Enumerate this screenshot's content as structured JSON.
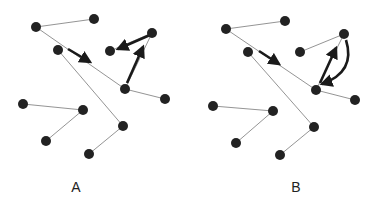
{
  "colors": {
    "node": "#222222",
    "edge": "#888888",
    "arrow": "#1a1a1a",
    "background": "#ffffff"
  },
  "panels": [
    {
      "label": "A",
      "label_pos": [
        76,
        187
      ],
      "nodes": [
        [
          36,
          27
        ],
        [
          94,
          19
        ],
        [
          58,
          50
        ],
        [
          152,
          33
        ],
        [
          110,
          51
        ],
        [
          125,
          89
        ],
        [
          165,
          99
        ],
        [
          23,
          104
        ],
        [
          83,
          110
        ],
        [
          123,
          126
        ],
        [
          46,
          141
        ],
        [
          89,
          154
        ]
      ],
      "edges": [
        [
          0,
          1
        ],
        [
          0,
          5
        ],
        [
          5,
          6
        ],
        [
          5,
          3
        ],
        [
          3,
          4
        ],
        [
          2,
          9
        ],
        [
          9,
          11
        ],
        [
          7,
          8
        ],
        [
          8,
          10
        ]
      ],
      "arrows": [
        {
          "from": [
            68,
            49
          ],
          "to": [
            90,
            62
          ],
          "curved": false
        },
        {
          "from": [
            150,
            35
          ],
          "to": [
            118,
            49
          ],
          "curved": false,
          "start_ratio": 0.25
        },
        {
          "from": [
            127,
            83
          ],
          "to": [
            143,
            47
          ],
          "curved": false
        }
      ]
    },
    {
      "label": "B",
      "label_pos": [
        296,
        187
      ],
      "nodes": [
        [
          226,
          29
        ],
        [
          285,
          21
        ],
        [
          248,
          52
        ],
        [
          344,
          34
        ],
        [
          300,
          52
        ],
        [
          316,
          90
        ],
        [
          355,
          100
        ],
        [
          213,
          106
        ],
        [
          273,
          111
        ],
        [
          314,
          127
        ],
        [
          236,
          143
        ],
        [
          280,
          155
        ]
      ],
      "edges": [
        [
          0,
          1
        ],
        [
          0,
          5
        ],
        [
          5,
          6
        ],
        [
          5,
          3
        ],
        [
          3,
          4
        ],
        [
          2,
          9
        ],
        [
          9,
          11
        ],
        [
          7,
          8
        ],
        [
          8,
          10
        ]
      ],
      "arrows": [
        {
          "from": [
            259,
            51
          ],
          "to": [
            279,
            64
          ],
          "curved": false
        },
        {
          "from": [
            320,
            83
          ],
          "to": [
            336,
            48
          ],
          "curved": false
        },
        {
          "from": [
            346,
            40
          ],
          "to": [
            322,
            84
          ],
          "curved": true,
          "control": [
            356,
            72
          ]
        }
      ]
    }
  ]
}
